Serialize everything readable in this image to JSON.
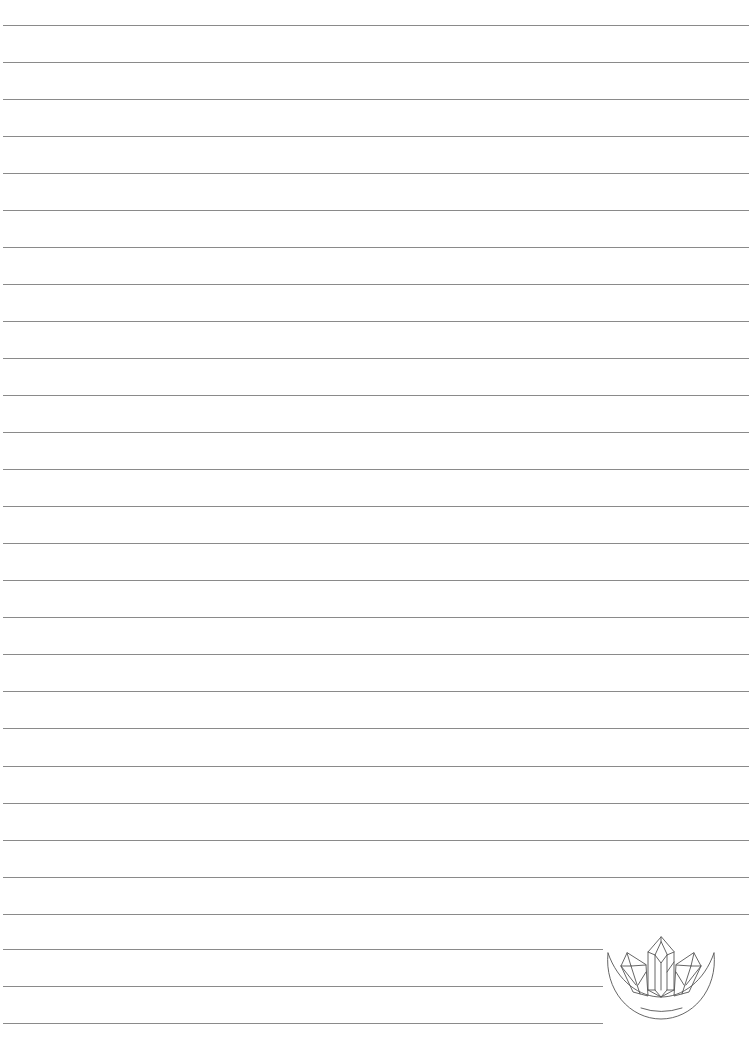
{
  "page": {
    "type": "lined-notebook-page",
    "background_color": "#ffffff",
    "rule_color": "#8a8a8a",
    "full_rules": {
      "count": 25,
      "start_y": 24.5,
      "spacing": 37.05,
      "x_start": 3,
      "x_end": 749
    },
    "short_rules": {
      "count": 3,
      "ys": [
        949,
        986,
        1023
      ],
      "x_start": 3,
      "x_end": 603
    }
  },
  "emblem": {
    "icon": "crystal-moon-icon",
    "stroke_color": "#555555"
  }
}
